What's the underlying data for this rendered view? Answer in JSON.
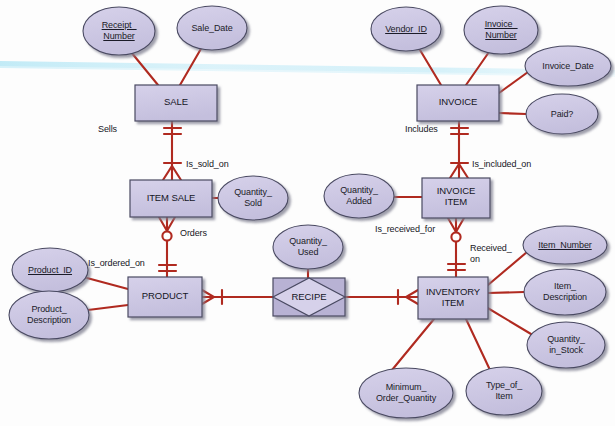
{
  "diagram": {
    "notation": "crow's-foot",
    "colors": {
      "shape_fill": "#c9c4e0",
      "shape_fill_light": "#d4cfe8",
      "shape_stroke": "#4a4a62",
      "line": "#b02a20",
      "text": "#1b1b28",
      "background": "#fdfdfd",
      "scanline": "#c8eef7",
      "shadow": "#8d8d9c"
    },
    "entities": [
      {
        "id": "sale",
        "label": "SALE",
        "x": 135,
        "y": 85,
        "w": 82,
        "h": 36
      },
      {
        "id": "invoice",
        "label": "INVOICE",
        "x": 417,
        "y": 85,
        "w": 82,
        "h": 36
      },
      {
        "id": "item_sale",
        "label": "ITEM SALE",
        "x": 130,
        "y": 180,
        "w": 82,
        "h": 37
      },
      {
        "id": "invoice_item",
        "label": "INVOICE\nITEM",
        "x": 422,
        "y": 178,
        "w": 68,
        "h": 40
      },
      {
        "id": "product",
        "label": "PRODUCT",
        "x": 128,
        "y": 277,
        "w": 74,
        "h": 40
      },
      {
        "id": "inventory_item",
        "label": "INVENTORY\nITEM",
        "x": 418,
        "y": 277,
        "w": 70,
        "h": 42
      }
    ],
    "associative_entities": [
      {
        "id": "recipe",
        "label": "RECIPE",
        "x": 273,
        "y": 278,
        "w": 72,
        "h": 38
      }
    ],
    "attributes": [
      {
        "id": "receipt_number",
        "label": "Receipt_\nNumber",
        "key": true,
        "cx": 119,
        "cy": 31,
        "rx": 36,
        "ry": 24
      },
      {
        "id": "sale_date",
        "label": "Sale_Date",
        "key": false,
        "cx": 212,
        "cy": 28,
        "rx": 35,
        "ry": 22
      },
      {
        "id": "vendor_id",
        "label": "Vendor_ID",
        "key": true,
        "cx": 406,
        "cy": 29,
        "rx": 35,
        "ry": 22
      },
      {
        "id": "invoice_number",
        "label": "Invoice_\nNumber",
        "key": true,
        "cx": 501,
        "cy": 30,
        "rx": 37,
        "ry": 24
      },
      {
        "id": "invoice_date",
        "label": "Invoice_Date",
        "key": false,
        "cx": 568,
        "cy": 66,
        "rx": 43,
        "ry": 20
      },
      {
        "id": "paid",
        "label": "Paid?",
        "key": false,
        "cx": 562,
        "cy": 114,
        "rx": 36,
        "ry": 20
      },
      {
        "id": "quantity_sold",
        "label": "Quantity_\nSold",
        "key": false,
        "cx": 253,
        "cy": 198,
        "rx": 35,
        "ry": 22
      },
      {
        "id": "quantity_added",
        "label": "Quantity_\nAdded",
        "key": false,
        "cx": 359,
        "cy": 196,
        "rx": 35,
        "ry": 22
      },
      {
        "id": "product_id",
        "label": "Product_ID",
        "key": true,
        "cx": 50,
        "cy": 270,
        "rx": 38,
        "ry": 22
      },
      {
        "id": "product_desc",
        "label": "Product_\nDescription",
        "key": false,
        "cx": 49,
        "cy": 315,
        "rx": 40,
        "ry": 24
      },
      {
        "id": "quantity_used",
        "label": "Quantity_\nUsed",
        "key": false,
        "cx": 308,
        "cy": 247,
        "rx": 35,
        "ry": 22
      },
      {
        "id": "item_number",
        "label": "Item_Number",
        "key": true,
        "cx": 565,
        "cy": 245,
        "rx": 42,
        "ry": 19
      },
      {
        "id": "item_desc",
        "label": "Item_\nDescription",
        "key": false,
        "cx": 565,
        "cy": 292,
        "rx": 41,
        "ry": 23
      },
      {
        "id": "quantity_stock",
        "label": "Quantity_\nin_Stock",
        "key": false,
        "cx": 566,
        "cy": 345,
        "rx": 39,
        "ry": 23
      },
      {
        "id": "min_order_qty",
        "label": "Minimum_\nOrder_Quantity",
        "key": false,
        "cx": 406,
        "cy": 393,
        "rx": 47,
        "ry": 25
      },
      {
        "id": "type_of_item",
        "label": "Type_of_\nItem",
        "key": false,
        "cx": 504,
        "cy": 391,
        "rx": 38,
        "ry": 24
      }
    ],
    "relationship_labels": [
      {
        "id": "sells",
        "label": "Sells",
        "x": 98,
        "y": 124
      },
      {
        "id": "is_sold_on",
        "label": "Is_sold_on",
        "x": 168,
        "y": 160
      },
      {
        "id": "includes",
        "label": "Includes",
        "x": 405,
        "y": 124
      },
      {
        "id": "is_included_on",
        "label": "Is_included_on",
        "x": 466,
        "y": 160
      },
      {
        "id": "orders",
        "label": "Orders",
        "x": 175,
        "y": 228
      },
      {
        "id": "is_ordered_on",
        "label": "Is_ordered_on",
        "x": 88,
        "y": 258
      },
      {
        "id": "is_received_for",
        "label": "Is_received_for",
        "x": 375,
        "y": 224
      },
      {
        "id": "received_on",
        "label": "Received_\non",
        "x": 468,
        "y": 244
      }
    ],
    "connections": [
      {
        "from": "receipt_number",
        "to": "sale",
        "type": "attribute"
      },
      {
        "from": "sale_date",
        "to": "sale",
        "type": "attribute"
      },
      {
        "from": "vendor_id",
        "to": "invoice",
        "type": "attribute"
      },
      {
        "from": "invoice_number",
        "to": "invoice",
        "type": "attribute"
      },
      {
        "from": "invoice_date",
        "to": "invoice",
        "type": "attribute"
      },
      {
        "from": "paid",
        "to": "invoice",
        "type": "attribute"
      },
      {
        "from": "quantity_sold",
        "to": "item_sale",
        "type": "attribute"
      },
      {
        "from": "quantity_added",
        "to": "invoice_item",
        "type": "attribute"
      },
      {
        "from": "product_id",
        "to": "product",
        "type": "attribute"
      },
      {
        "from": "product_desc",
        "to": "product",
        "type": "attribute"
      },
      {
        "from": "quantity_used",
        "to": "recipe",
        "type": "attribute"
      },
      {
        "from": "item_number",
        "to": "inventory_item",
        "type": "attribute"
      },
      {
        "from": "item_desc",
        "to": "inventory_item",
        "type": "attribute"
      },
      {
        "from": "quantity_stock",
        "to": "inventory_item",
        "type": "attribute"
      },
      {
        "from": "min_order_qty",
        "to": "inventory_item",
        "type": "attribute"
      },
      {
        "from": "type_of_item",
        "to": "inventory_item",
        "type": "attribute"
      },
      {
        "from": "sale",
        "to": "item_sale",
        "type": "one-to-many",
        "label": "Sells / Is_sold_on"
      },
      {
        "from": "invoice",
        "to": "invoice_item",
        "type": "one-to-many",
        "label": "Includes / Is_included_on"
      },
      {
        "from": "item_sale",
        "to": "product",
        "type": "many-to-one-optional",
        "label": "Orders / Is_ordered_on"
      },
      {
        "from": "invoice_item",
        "to": "inventory_item",
        "type": "many-to-one-optional",
        "label": "Is_received_for / Received_on"
      },
      {
        "from": "product",
        "to": "recipe",
        "type": "many-to-one"
      },
      {
        "from": "recipe",
        "to": "inventory_item",
        "type": "one-to-many"
      }
    ]
  }
}
